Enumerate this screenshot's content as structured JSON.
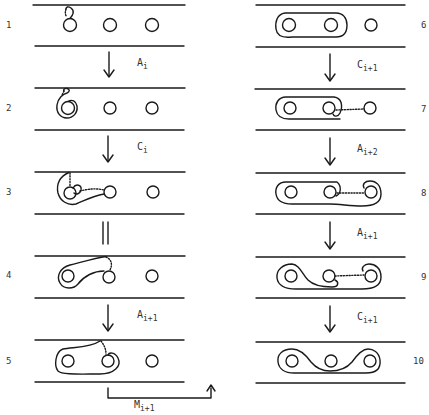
{
  "diagram": {
    "type": "curve-isotopy-sequence",
    "left_column": {
      "steps": [
        {
          "number": "1"
        },
        {
          "number": "2"
        },
        {
          "number": "3"
        },
        {
          "number": "4"
        },
        {
          "number": "5"
        }
      ],
      "transitions": [
        {
          "from": "1",
          "to": "2",
          "kind": "arrow",
          "label": "A",
          "sub": "i"
        },
        {
          "from": "2",
          "to": "3",
          "kind": "arrow",
          "label": "C",
          "sub": "i"
        },
        {
          "from": "3",
          "to": "4",
          "kind": "equals",
          "label": "",
          "sub": ""
        },
        {
          "from": "4",
          "to": "5",
          "kind": "arrow",
          "label": "A",
          "sub": "i+1"
        }
      ]
    },
    "bridge": {
      "from": "5",
      "to": "6",
      "label": "M",
      "sub": "i+1"
    },
    "right_column": {
      "steps": [
        {
          "number": "6"
        },
        {
          "number": "7"
        },
        {
          "number": "8"
        },
        {
          "number": "9"
        },
        {
          "number": "10"
        }
      ],
      "transitions": [
        {
          "from": "6",
          "to": "7",
          "kind": "arrow",
          "label": "C",
          "sub": "i+1"
        },
        {
          "from": "7",
          "to": "8",
          "kind": "arrow",
          "label": "A",
          "sub": "i+2"
        },
        {
          "from": "8",
          "to": "9",
          "kind": "arrow",
          "label": "A",
          "sub": "i+1"
        },
        {
          "from": "9",
          "to": "10",
          "kind": "arrow",
          "label": "C",
          "sub": "i+1"
        }
      ]
    },
    "punctures_per_strip": 3
  }
}
